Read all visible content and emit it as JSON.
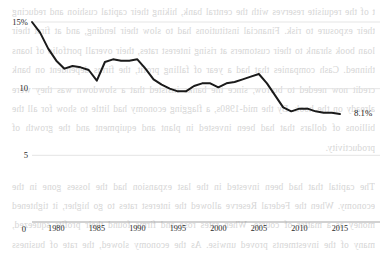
{
  "chart_data": {
    "type": "line",
    "title": "",
    "subtitle": "",
    "xlabel": "",
    "ylabel": "",
    "xlim": [
      1977,
      2016
    ],
    "ylim": [
      0,
      15
    ],
    "grid": true,
    "grid_axis": "y",
    "legend": "none",
    "line_color": "#1a1a1a",
    "line_width": 2.0,
    "y_ticks": [
      {
        "value": 15,
        "label": "15%"
      },
      {
        "value": 10,
        "label": "10"
      },
      {
        "value": 5,
        "label": "5"
      },
      {
        "value": 0,
        "label": "0"
      }
    ],
    "x_ticks": [
      {
        "value": 1980,
        "label": "1980"
      },
      {
        "value": 1985,
        "label": "1985"
      },
      {
        "value": 1990,
        "label": "1990"
      },
      {
        "value": 1995,
        "label": "1995"
      },
      {
        "value": 2000,
        "label": "2000"
      },
      {
        "value": 2005,
        "label": "2005"
      },
      {
        "value": 2010,
        "label": "2010"
      },
      {
        "value": 2015,
        "label": "2015"
      }
    ],
    "annotations": [
      {
        "name": "end-value",
        "text": "8.1%",
        "x": 2016,
        "y": 8.1
      }
    ],
    "x": [
      1977,
      1978,
      1979,
      1980,
      1981,
      1982,
      1983,
      1984,
      1985,
      1986,
      1987,
      1988,
      1989,
      1990,
      1991,
      1992,
      1993,
      1994,
      1995,
      1996,
      1997,
      1998,
      1999,
      2000,
      2001,
      2002,
      2003,
      2004,
      2005,
      2006,
      2007,
      2008,
      2009,
      2010,
      2011,
      2012,
      2013,
      2014,
      2015
    ],
    "values": [
      15.0,
      14.2,
      13.0,
      12.1,
      11.5,
      11.7,
      11.6,
      11.4,
      10.6,
      12.0,
      12.2,
      12.1,
      12.1,
      12.2,
      11.5,
      10.7,
      10.3,
      10.0,
      9.8,
      9.8,
      10.2,
      10.4,
      10.4,
      10.1,
      10.4,
      10.5,
      10.7,
      10.9,
      11.1,
      10.4,
      9.5,
      8.6,
      8.3,
      8.5,
      8.5,
      8.3,
      8.2,
      8.2,
      8.1
    ]
  },
  "bleed_text": "t of the requisite reserves with the central bank, hiking their capital cushion and reducing their exposure to risk. Financial institutions had to slow their lending, and at first their loan book shrank to their customers at rising interest rates, their overall portfolio of loans thinned. Cash companies that had a year of falling profit, the firms dependent on bank credit now needed to borrow, since the banks insisted that a slowdown was they were already on the hook. By the mid-1980s, a flagging economy had little to show for all the billions of dollars that had been invested in plant and equipment and the growth of productivity.\n\nThe capital that had been invested in the last expansion had the losses gone in the economy. When the Federal Reserve allowed the interest rates to go higher, it tightened money as a matter of course. When rates rose and firms found their profits squeezed, many of the investments proved unwise. As the economy slowed, the rate of business failures began to climb as money became tighter; few of those investments were ever recouped, and the productivity boom faded."
}
